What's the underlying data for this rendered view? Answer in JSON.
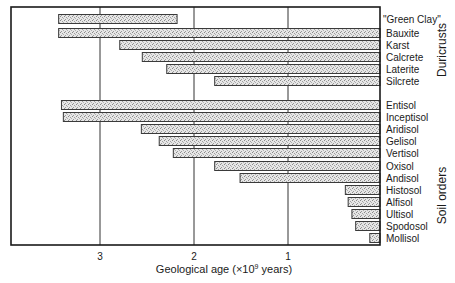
{
  "chart_data": {
    "type": "bar",
    "orientation": "horizontal",
    "title": "",
    "xlabel": "Geological age (×10⁹ years)",
    "xlabel_parts": {
      "prefix": "Geological age (×10",
      "sup": "9",
      "suffix": " years)"
    },
    "ylabel": "",
    "x_axis_reversed": true,
    "xlim": [
      0,
      3.75
    ],
    "xticks": [
      3,
      2,
      1
    ],
    "xtick_labels": [
      "3",
      "2",
      "1"
    ],
    "grid": {
      "vertical_lines_at": [
        3,
        2,
        1
      ]
    },
    "bar_fill": "stippled grey",
    "groups": [
      {
        "name": "Duricrusts",
        "items": [
          {
            "label": "\"Green Clay\"",
            "start": 3.44,
            "end": 2.18
          },
          {
            "label": "Bauxite",
            "start": 3.44,
            "end": 0
          },
          {
            "label": "Karst",
            "start": 2.79,
            "end": 0
          },
          {
            "label": "Calcrete",
            "start": 2.55,
            "end": 0
          },
          {
            "label": "Laterite",
            "start": 2.29,
            "end": 0
          },
          {
            "label": "Silcrete",
            "start": 1.78,
            "end": 0
          }
        ]
      },
      {
        "name": "Soil orders",
        "items": [
          {
            "label": "Entisol",
            "start": 3.41,
            "end": 0
          },
          {
            "label": "Inceptisol",
            "start": 3.39,
            "end": 0
          },
          {
            "label": "Aridisol",
            "start": 2.56,
            "end": 0
          },
          {
            "label": "Gelisol",
            "start": 2.37,
            "end": 0
          },
          {
            "label": "Vertisol",
            "start": 2.22,
            "end": 0
          },
          {
            "label": "Oxisol",
            "start": 1.78,
            "end": 0
          },
          {
            "label": "Andisol",
            "start": 1.51,
            "end": 0
          },
          {
            "label": "Histosol",
            "start": 0.39,
            "end": 0
          },
          {
            "label": "Alfisol",
            "start": 0.36,
            "end": 0
          },
          {
            "label": "Ultisol",
            "start": 0.32,
            "end": 0
          },
          {
            "label": "Spodosol",
            "start": 0.28,
            "end": 0
          },
          {
            "label": "Mollisol",
            "start": 0.13,
            "end": 0
          }
        ]
      }
    ]
  }
}
